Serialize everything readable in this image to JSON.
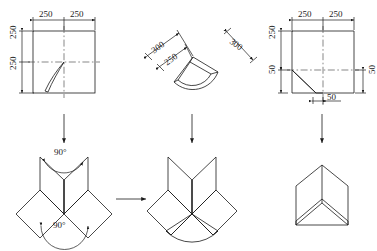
{
  "figure": {
    "stroke_color": "#1a1a1a",
    "dash_color": "#555555",
    "text_color": "#1a1a1a"
  },
  "panels": {
    "top_left": {
      "name": "flat-pattern-square",
      "dimensions": {
        "top_left_width": "250",
        "top_right_width": "250",
        "left_upper_height": "250",
        "left_lower_height": "250"
      }
    },
    "top_middle": {
      "name": "flat-pattern-fan",
      "dimensions": {
        "outer_left": "300",
        "inner_left": "250",
        "outer_right": "300"
      }
    },
    "top_right": {
      "name": "flat-pattern-chamfer",
      "dimensions": {
        "top_left_width": "250",
        "top_right_width": "250",
        "left_upper_height": "250",
        "left_lower_height": "50",
        "right_lower_height": "50",
        "bottom_offset": "50"
      }
    },
    "bottom_left": {
      "name": "folded-star-with-angles",
      "angles": {
        "upper": "90°",
        "lower": "90°"
      }
    },
    "bottom_middle": {
      "name": "folded-star-with-fan"
    },
    "bottom_right": {
      "name": "assembled-corner-solid"
    }
  },
  "arrows": {
    "down_left": "arrow-down",
    "down_middle": "arrow-down",
    "down_right": "arrow-down",
    "across": "arrow-right"
  }
}
